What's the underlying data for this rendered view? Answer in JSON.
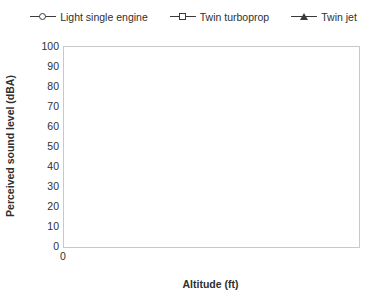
{
  "legend": {
    "position": "top-center",
    "items": [
      {
        "label": "Light single engine",
        "marker": "circle"
      },
      {
        "label": "Twin turboprop",
        "marker": "square"
      },
      {
        "label": "Twin jet",
        "marker": "triangle"
      }
    ]
  },
  "axes": {
    "x_title": "Altitude (ft)",
    "y_title": "Perceived sound level (dBA)",
    "x_ticks": [
      "0",
      "5,000",
      "10,000",
      "15,000",
      "20,000",
      "25,000"
    ],
    "y_ticks": [
      "0",
      "10",
      "20",
      "30",
      "40",
      "50",
      "60",
      "70",
      "80",
      "90",
      "100"
    ]
  },
  "style": {
    "line_color": "#3b3b3b",
    "marker_fill": "#ffffff",
    "frame_color": "#c9c9c9",
    "background": "#ffffff"
  },
  "chart_data": {
    "type": "line",
    "title": "",
    "xlabel": "Altitude (ft)",
    "ylabel": "Perceived sound level (dBA)",
    "xlim": [
      0,
      25000
    ],
    "ylim": [
      0,
      100
    ],
    "xticks": [
      0,
      5000,
      10000,
      15000,
      20000,
      25000
    ],
    "yticks": [
      0,
      10,
      20,
      30,
      40,
      50,
      60,
      70,
      80,
      90,
      100
    ],
    "grid": false,
    "legend_position": "top-center",
    "x": [
      0,
      500,
      1000,
      1500,
      2000,
      2500,
      3000,
      3500,
      4000,
      4500,
      5000,
      6000,
      7000,
      8000,
      9000,
      10000,
      11000,
      12000,
      13000,
      14000,
      15000,
      16000,
      17000,
      18000,
      19000,
      20000,
      21000,
      22000,
      23000,
      24000,
      25000
    ],
    "series": [
      {
        "name": "Light single engine",
        "marker": "circle",
        "values": [
          65,
          61.5,
          57.5,
          54.5,
          51.5,
          49.5,
          47.5,
          46,
          45,
          44,
          43,
          41,
          39.5,
          38.5,
          37.5,
          36.5,
          35.8,
          35.2,
          34.6,
          34.1,
          33.6,
          33.2,
          32.8,
          32.4,
          32.1,
          31.7,
          31.4,
          31.1,
          30.7,
          30.4,
          30
        ]
      },
      {
        "name": "Twin turboprop",
        "marker": "square",
        "values": [
          79,
          75.5,
          71.5,
          68.5,
          66,
          64.5,
          63,
          61.8,
          60.6,
          59.5,
          58.5,
          56.5,
          54.8,
          53.2,
          51.8,
          50.5,
          49.6,
          48.8,
          48.1,
          47.5,
          47,
          46.6,
          46.2,
          45.8,
          45.4,
          45.1,
          44.8,
          44.5,
          44.3,
          44.1,
          44
        ]
      },
      {
        "name": "Twin jet",
        "marker": "triangle",
        "values": [
          91,
          87,
          83,
          79.5,
          77,
          75.2,
          73.6,
          72.3,
          71.2,
          70.4,
          69.6,
          68,
          66.5,
          65.2,
          63.9,
          62.7,
          61.8,
          61,
          60.3,
          59.7,
          59.1,
          58.6,
          58.1,
          57.6,
          57.2,
          56.8,
          56.4,
          56,
          55.6,
          55.3,
          55
        ]
      }
    ]
  }
}
